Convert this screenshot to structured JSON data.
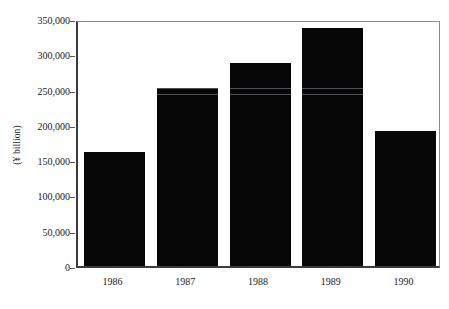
{
  "chart_data": {
    "type": "bar",
    "title": "",
    "subtitle": "",
    "xlabel": "",
    "ylabel": "(¥ billion)",
    "categories": [
      "1986",
      "1987",
      "1988",
      "1989",
      "1990"
    ],
    "values": [
      162000,
      252000,
      287000,
      337000,
      192000
    ],
    "series": [
      {
        "name": "",
        "values": [
          162000,
          252000,
          287000,
          337000,
          192000
        ]
      }
    ],
    "ylim": [
      0,
      350000
    ],
    "y_ticks": [
      0,
      50000,
      100000,
      150000,
      200000,
      250000,
      300000,
      350000
    ],
    "y_tick_labels": [
      "0",
      "50,000",
      "100,000",
      "150,000",
      "200,000",
      "250,000",
      "300,000",
      "350,000"
    ],
    "grid": false,
    "legend": null,
    "legend_position": "none",
    "bar_color": "#070707",
    "axis_color": "#3a3b3f",
    "frame_color": "#8a8b8f",
    "annotations": []
  },
  "figure": {
    "background_color": "#ffffff",
    "text_color": "#1a1a1a"
  }
}
